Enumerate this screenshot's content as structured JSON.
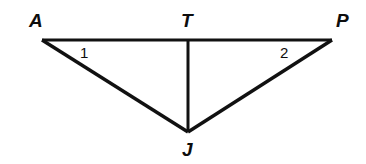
{
  "figure": {
    "kind": "geometry-diagram",
    "background_color": "#ffffff",
    "stroke_color": "#111111",
    "text_color": "#0d0d0d",
    "width": 366,
    "height": 164,
    "points": {
      "A": {
        "label": "A",
        "x": 42,
        "y": 40
      },
      "T": {
        "label": "T",
        "x": 188,
        "y": 40
      },
      "P": {
        "label": "P",
        "x": 332,
        "y": 40
      },
      "J": {
        "label": "J",
        "x": 188,
        "y": 132
      }
    },
    "segments": [
      {
        "name": "AP",
        "from": "A",
        "to": "P",
        "x1": 42,
        "y1": 40,
        "x2": 332,
        "y2": 40,
        "width": 3
      },
      {
        "name": "AJ",
        "from": "A",
        "to": "J",
        "x1": 42,
        "y1": 40,
        "x2": 188,
        "y2": 132,
        "width": 3.4
      },
      {
        "name": "PJ",
        "from": "P",
        "to": "J",
        "x1": 332,
        "y1": 40,
        "x2": 188,
        "y2": 132,
        "width": 3.4
      },
      {
        "name": "TJ",
        "from": "T",
        "to": "J",
        "x1": 188,
        "y1": 40,
        "x2": 188,
        "y2": 132,
        "width": 3
      }
    ],
    "angle_marks": [
      {
        "name": "angle-1",
        "label": "1",
        "at_vertex": "A",
        "x": 85,
        "y": 53
      },
      {
        "name": "angle-2",
        "label": "2",
        "at_vertex": "P",
        "x": 285,
        "y": 53
      }
    ]
  }
}
